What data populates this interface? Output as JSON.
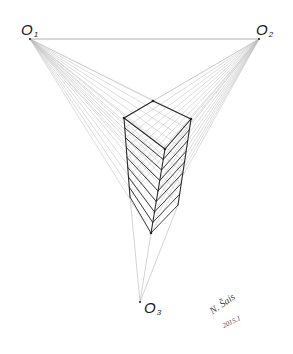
{
  "diagram": {
    "vanishing_points": [
      {
        "label": "O",
        "sub": "1",
        "x": 30,
        "y": 39
      },
      {
        "label": "O",
        "sub": "2",
        "x": 259,
        "y": 39
      },
      {
        "label": "O",
        "sub": "3",
        "x": 140,
        "y": 302
      }
    ],
    "box": {
      "top_back": [
        153,
        101
      ],
      "top_left": [
        124,
        118
      ],
      "top_right": [
        191,
        119
      ],
      "top_front": [
        165,
        149
      ],
      "bottom_left": [
        130,
        197
      ],
      "bottom_right": [
        178,
        205
      ],
      "bottom_front": [
        151,
        233
      ],
      "slices": 8
    },
    "colors": {
      "construction": "#b8b8b8",
      "edges": "#2a2a2a",
      "background": "#ffffff"
    },
    "signature": {
      "name": "N. Šais",
      "date": "2015.1"
    }
  }
}
